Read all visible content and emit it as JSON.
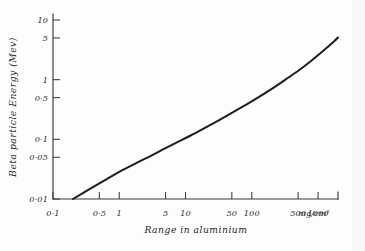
{
  "chart_data": {
    "type": "line",
    "title": "",
    "xlabel": "Range in aluminium",
    "xunit": "mg/cm²",
    "ylabel": "Beta particle Energy (Mev)",
    "xscale": "log",
    "yscale": "log",
    "xlim": [
      0.1,
      2000
    ],
    "ylim": [
      0.01,
      10
    ],
    "grid": false,
    "legend": null,
    "xticks": [
      {
        "value": 0.1,
        "label": "0·1"
      },
      {
        "value": 0.5,
        "label": "0·5"
      },
      {
        "value": 1,
        "label": "1"
      },
      {
        "value": 5,
        "label": "5"
      },
      {
        "value": 10,
        "label": "10"
      },
      {
        "value": 50,
        "label": "50"
      },
      {
        "value": 100,
        "label": "100"
      },
      {
        "value": 500,
        "label": "500"
      },
      {
        "value": 1000,
        "label": "1000"
      }
    ],
    "yticks": [
      {
        "value": 0.01,
        "label": "0·01"
      },
      {
        "value": 0.05,
        "label": "0·05"
      },
      {
        "value": 0.1,
        "label": "0·1"
      },
      {
        "value": 0.5,
        "label": "0·5"
      },
      {
        "value": 1,
        "label": "1"
      },
      {
        "value": 5,
        "label": "5"
      },
      {
        "value": 10,
        "label": "10"
      }
    ],
    "series": [
      {
        "name": "Beta particle energy vs range in aluminium",
        "color": "#1d1d1d",
        "points": [
          {
            "x": 0.2,
            "y": 0.01
          },
          {
            "x": 0.35,
            "y": 0.0145
          },
          {
            "x": 0.6,
            "y": 0.0205
          },
          {
            "x": 1.0,
            "y": 0.0285
          },
          {
            "x": 1.8,
            "y": 0.04
          },
          {
            "x": 3.0,
            "y": 0.053
          },
          {
            "x": 5.0,
            "y": 0.071
          },
          {
            "x": 9.0,
            "y": 0.099
          },
          {
            "x": 15.0,
            "y": 0.132
          },
          {
            "x": 25.0,
            "y": 0.18
          },
          {
            "x": 45.0,
            "y": 0.26
          },
          {
            "x": 75.0,
            "y": 0.36
          },
          {
            "x": 120.0,
            "y": 0.49
          },
          {
            "x": 200.0,
            "y": 0.7
          },
          {
            "x": 330.0,
            "y": 1.02
          },
          {
            "x": 520.0,
            "y": 1.45
          },
          {
            "x": 800.0,
            "y": 2.1
          },
          {
            "x": 1200.0,
            "y": 3.05
          },
          {
            "x": 1750.0,
            "y": 4.4
          },
          {
            "x": 2000.0,
            "y": 5.1
          }
        ]
      }
    ]
  },
  "figure": {
    "background_color": "#fdfdfd",
    "ink_color": "#1d1d1d",
    "axis_color": "#3a3a3a"
  }
}
